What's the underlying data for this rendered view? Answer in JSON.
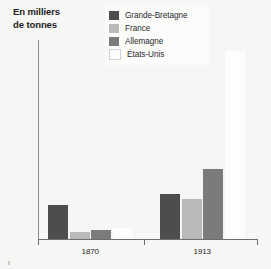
{
  "chart_data": {
    "type": "bar",
    "title": "En milliers de tonnes",
    "title_line1": "En milliers",
    "title_line2": "de tonnes",
    "xlabel": "",
    "ylabel": "En milliers de tonnes",
    "categories": [
      "1870",
      "1913"
    ],
    "ylim": [
      0,
      35000
    ],
    "ytick_step": 5000,
    "ytick_labels": [
      "0",
      "5000",
      "10 000",
      "15 000",
      "20 000",
      "25 000",
      "30 000",
      "35 000"
    ],
    "ytick_values": [
      0,
      5000,
      10000,
      15000,
      20000,
      25000,
      30000,
      35000
    ],
    "grid": false,
    "legend_position": "top-center",
    "series": [
      {
        "name": "Grande-Bretagne",
        "color": "#4d4d4d",
        "values": [
          6000,
          8000
        ]
      },
      {
        "name": "France",
        "color": "#b9b9b9",
        "values": [
          1300,
          7000
        ]
      },
      {
        "name": "Allemagne",
        "color": "#7b7b7b",
        "values": [
          1500,
          12400
        ]
      },
      {
        "name": "États-Unis",
        "color": "#fdfdfd",
        "values": [
          1900,
          33000
        ]
      }
    ]
  },
  "legend": {
    "items": [
      {
        "label": "Grande-Bretagne",
        "color": "#4d4d4d"
      },
      {
        "label": "France",
        "color": "#b9b9b9"
      },
      {
        "label": "Allemagne",
        "color": "#7b7b7b"
      },
      {
        "label": "États-Unis",
        "color": "#fdfdfd"
      }
    ]
  },
  "axes": {
    "y_labels": [
      "35 000",
      "30 000",
      "25 000",
      "20 000",
      "15 000",
      "10 000",
      "5000",
      "0"
    ],
    "x_labels": [
      "1870",
      "1913"
    ]
  }
}
